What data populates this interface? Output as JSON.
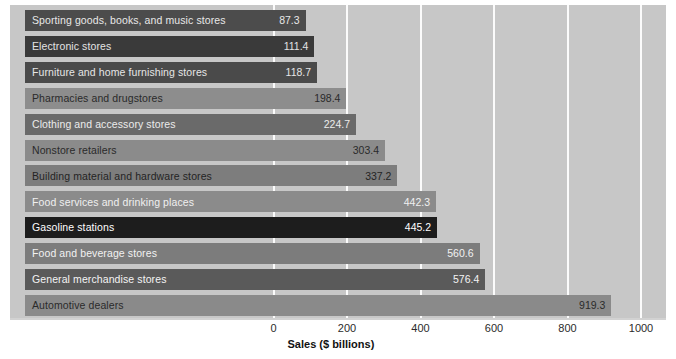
{
  "chart_data": {
    "type": "bar",
    "orientation": "horizontal",
    "title": "",
    "xlabel": "Sales ($ billions)",
    "ylabel": "",
    "xlim": [
      0,
      1000
    ],
    "xticks": [
      0,
      200,
      400,
      600,
      800,
      1000
    ],
    "xtick_labels": [
      "0",
      "200",
      "400",
      "600",
      "800",
      "1000"
    ],
    "grid": "vertical-white",
    "legend": "none",
    "categories": [
      "Sporting goods, books, and music stores",
      "Electronic stores",
      "Furniture and home furnishing stores",
      "Pharmacies and drugstores",
      "Clothing and accessory stores",
      "Nonstore retailers",
      "Building material and hardware stores",
      "Food services and drinking places",
      "Gasoline stations",
      "Food and beverage stores",
      "General merchandise stores",
      "Automotive dealers"
    ],
    "values": [
      87.3,
      111.4,
      118.7,
      198.4,
      224.7,
      303.4,
      337.2,
      442.3,
      445.2,
      560.6,
      576.4,
      919.3
    ],
    "value_labels": [
      "87.3",
      "111.4",
      "118.7",
      "198.4",
      "224.7",
      "303.4",
      "337.2",
      "442.3",
      "445.2",
      "560.6",
      "576.4",
      "919.3"
    ],
    "bar_colors": [
      "#4c4c4c",
      "#3a3a3a",
      "#4a4a4a",
      "#8d8d8d",
      "#6a6a6a",
      "#8b8b8b",
      "#7d7d7d",
      "#8b8b8b",
      "#1d1d1d",
      "#7c7c7c",
      "#5a5a5a",
      "#8a8a8a"
    ],
    "label_colors": [
      "#e8e8e8",
      "#e4e4e4",
      "#e6e6e6",
      "#2a2a2a",
      "#ececec",
      "#2a2a2a",
      "#242424",
      "#f0f0f0",
      "#ffffff",
      "#f2f2f2",
      "#f4f4f4",
      "#2a2a2a"
    ],
    "plot_background": "#c7c7c7",
    "gridline_color": "#fbfbfb",
    "page_background": "#ffffff"
  }
}
